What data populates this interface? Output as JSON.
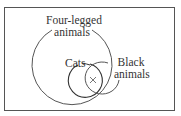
{
  "diagram": {
    "type": "venn",
    "sets": [
      {
        "id": "four-legged",
        "label_line1": "Four-legged",
        "label_line2": "animals"
      },
      {
        "id": "cats",
        "label": "Cats"
      },
      {
        "id": "black",
        "label_line1": "Black",
        "label_line2": "animals"
      }
    ],
    "marker": {
      "symbol": "×",
      "region": "cats ∩ black animals"
    },
    "colors": {
      "stroke": "#444444",
      "border": "#555555",
      "text": "#333333"
    }
  }
}
